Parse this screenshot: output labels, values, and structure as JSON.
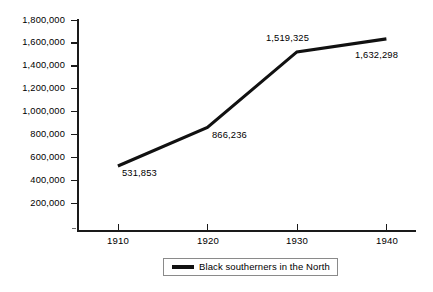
{
  "chart_data": {
    "type": "line",
    "title": "",
    "subtitle": "",
    "xlabel": "",
    "ylabel": "",
    "x": [
      1910,
      1920,
      1930,
      1940
    ],
    "categories": [
      "1910",
      "1920",
      "1930",
      "1940"
    ],
    "series": [
      {
        "name": "Black southerners in the North",
        "values": [
          531853,
          866236,
          1519325,
          1632298
        ],
        "color": "#111111"
      }
    ],
    "ylim": [
      0,
      1800000
    ],
    "xlim": [
      1905,
      1942
    ],
    "grid": false,
    "legend_position": "bottom-center",
    "y_ticks": [
      {
        "value": 1800000,
        "label": "1,800,000"
      },
      {
        "value": 1600000,
        "label": "1,600,000"
      },
      {
        "value": 1400000,
        "label": "1,400,000"
      },
      {
        "value": 1200000,
        "label": "1,200,000"
      },
      {
        "value": 1000000,
        "label": "1,000,000"
      },
      {
        "value": 800000,
        "label": "800,000"
      },
      {
        "value": 600000,
        "label": "600,000"
      },
      {
        "value": 400000,
        "label": "400,000"
      },
      {
        "value": 200000,
        "label": "200,000"
      }
    ],
    "x_ticks": [
      {
        "value": 1910,
        "label": "1910"
      },
      {
        "value": 1920,
        "label": "1920"
      },
      {
        "value": 1930,
        "label": "1930"
      },
      {
        "value": 1940,
        "label": "1940"
      }
    ],
    "point_labels": [
      {
        "label": "531,853",
        "x": 1910,
        "y": 531853,
        "placement": "below-right"
      },
      {
        "label": "866,236",
        "x": 1920,
        "y": 866236,
        "placement": "below-right"
      },
      {
        "label": "1,519,325",
        "x": 1930,
        "y": 1519325,
        "placement": "above-left"
      },
      {
        "label": "1,632,298",
        "x": 1940,
        "y": 1632298,
        "placement": "below-left"
      }
    ],
    "legend": [
      {
        "label": "Black southerners in the North",
        "color": "#111111"
      }
    ]
  },
  "axis": {
    "y_labels": [
      "1,800,000",
      "1,600,000",
      "1,400,000",
      "1,200,000",
      "1,000,000",
      "800,000",
      "600,000",
      "400,000",
      "200,000"
    ],
    "x_labels": [
      "1910",
      "1920",
      "1930",
      "1940"
    ]
  },
  "labels": {
    "p1910": "531,853",
    "p1920": "866,236",
    "p1930": "1,519,325",
    "p1940": "1,632,298"
  },
  "legend": {
    "series_1_label": "Black southerners in the North"
  }
}
